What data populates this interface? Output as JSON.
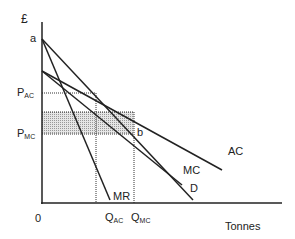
{
  "axes": {
    "y_label": "£",
    "x_label": "Tonnes",
    "origin": "0"
  },
  "points": {
    "a": "a",
    "b": "b"
  },
  "price_labels": [
    {
      "main": "P",
      "sub": "AC"
    },
    {
      "main": "P",
      "sub": "MC"
    }
  ],
  "quantity_labels": [
    {
      "main": "Q",
      "sub": "AC"
    },
    {
      "main": "Q",
      "sub": "MC"
    }
  ],
  "curves": {
    "AC": "AC",
    "MC": "MC",
    "D": "D",
    "MR": "MR"
  },
  "colors": {
    "line": "#222222",
    "shade": "#c8c8c8"
  }
}
